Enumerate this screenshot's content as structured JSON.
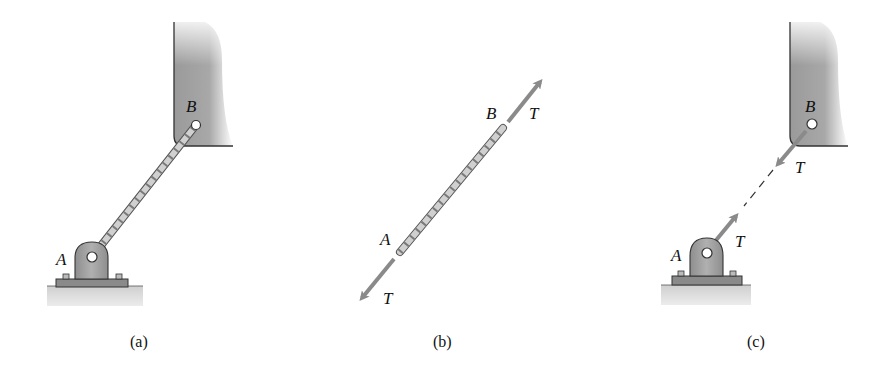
{
  "figure": {
    "panels": [
      {
        "id": "a",
        "caption": "(a)",
        "point_labels": {
          "A": "A",
          "B": "B"
        },
        "description": "Cable connecting pinned support A to wall bracket B"
      },
      {
        "id": "b",
        "caption": "(b)",
        "point_labels": {
          "A": "A",
          "B": "B"
        },
        "force_labels": {
          "top": "T",
          "bottom": "T"
        },
        "description": "Free-body diagram of cable with tension T at both ends"
      },
      {
        "id": "c",
        "caption": "(c)",
        "point_labels": {
          "A": "A",
          "B": "B"
        },
        "force_labels": {
          "atB": "T",
          "atA": "T"
        },
        "description": "Reactions T on support A and wall B, cable shown dashed"
      }
    ],
    "colors": {
      "wall": "#8c8c8c",
      "support": "#9a9a9a",
      "ground": "#d8d8d8",
      "arrow": "#8a8a8a",
      "cable": "#c8c8c8",
      "outline": "#333333"
    }
  }
}
